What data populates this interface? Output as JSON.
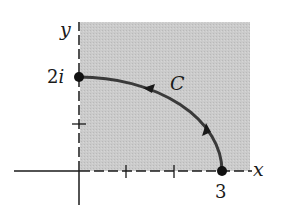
{
  "figure": {
    "labels": {
      "y_axis": "y",
      "x_axis": "x",
      "y_intercept": "2i",
      "x_intercept": "3",
      "curve": "C"
    },
    "colors": {
      "shaded_region": "#c8c8c8",
      "ink": "#1a1a1a",
      "curve": "#3a3a3a",
      "background": "#ffffff"
    },
    "points": [
      {
        "name": "start",
        "value": "3",
        "x": 3,
        "y": 0
      },
      {
        "name": "end",
        "value": "2i",
        "x": 0,
        "y": 2
      }
    ],
    "ticks": {
      "x": [
        1,
        2
      ],
      "y": [
        1
      ]
    },
    "curve": {
      "description": "Quarter-ellipse from 3 to 2i in the first quadrant, oriented counterclockwise",
      "direction": "counterclockwise",
      "arrow_count": 2
    },
    "region": "first quadrant shaded"
  }
}
